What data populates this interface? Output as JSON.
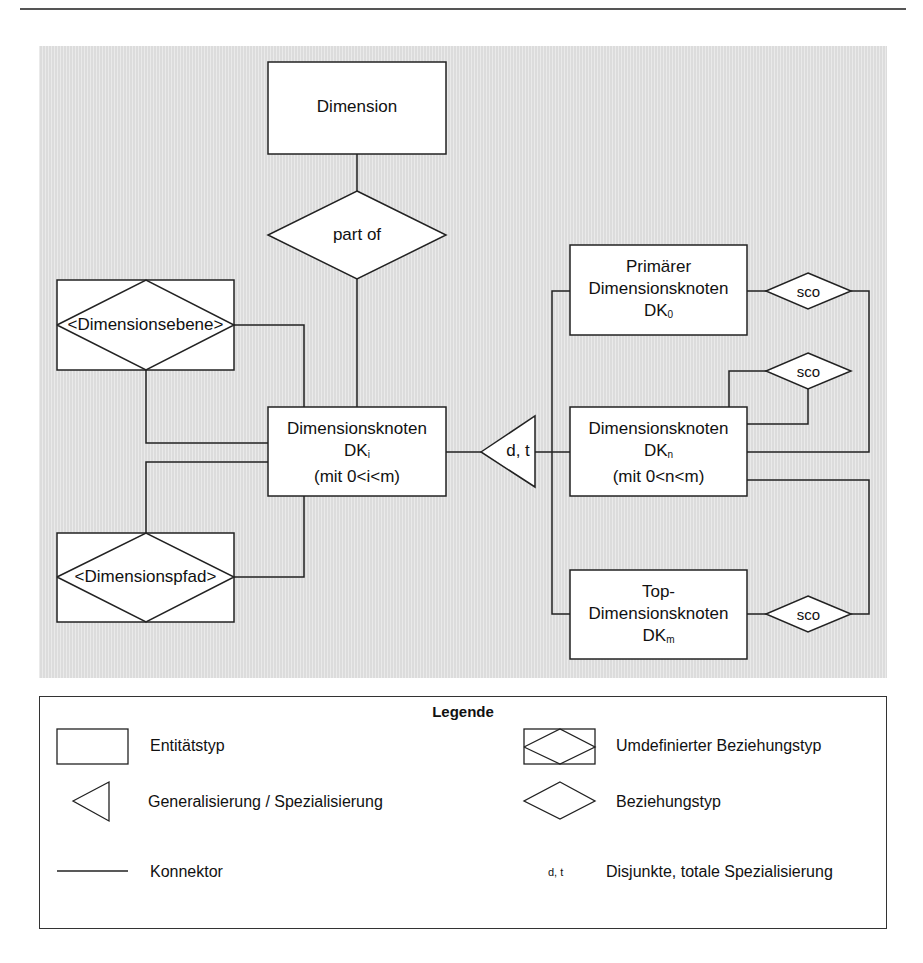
{
  "figure": {
    "background_color": "#e3e3e3",
    "stroke_color": "#222222"
  },
  "diagram": {
    "entities": {
      "dimension": "Dimension",
      "dk_i_line1": "Dimensionsknoten",
      "dk_i_line2": "DK",
      "dk_i_sub": "i",
      "dk_i_line3": "(mit 0<i<m)",
      "primary_line1": "Primärer",
      "primary_line2": "Dimensionsknoten",
      "primary_line3": "DK",
      "primary_sub": "0",
      "dk_n_line1": "Dimensionsknoten",
      "dk_n_line2": "DK",
      "dk_n_sub": "n",
      "dk_n_line3": "(mit 0<n<m)",
      "top_line1": "Top-",
      "top_line2": "Dimensionsknoten",
      "top_line3": "DK",
      "top_sub": "m"
    },
    "relationships": {
      "part_of": "part of",
      "sco_1": "sco",
      "sco_2": "sco",
      "sco_3": "sco"
    },
    "redefined_relationships": {
      "dimensionsebene": "<Dimensionsebene>",
      "dimensionspfad": "<Dimensionspfad>"
    },
    "specialization": {
      "label": "d, t"
    }
  },
  "legend": {
    "title": "Legende",
    "items": [
      {
        "symbol": "rectangle",
        "label": "Entitätstyp"
      },
      {
        "symbol": "rect-diamond",
        "label": "Umdefinierter Beziehungstyp"
      },
      {
        "symbol": "triangle",
        "label": "Generalisierung / Spezialisierung"
      },
      {
        "symbol": "diamond",
        "label": "Beziehungstyp"
      },
      {
        "symbol": "line",
        "label": "Konnektor"
      },
      {
        "symbol": "text",
        "symbol_text": "d, t",
        "label": "Disjunkte, totale Spezialisierung"
      }
    ]
  }
}
